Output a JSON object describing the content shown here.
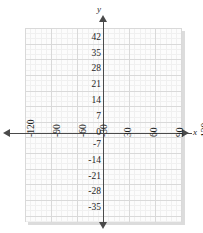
{
  "chart_data": {
    "type": "line",
    "title": "",
    "xlabel": "x",
    "ylabel": "y",
    "grid": true,
    "legend": null,
    "series": [],
    "xlim": [
      -130,
      130
    ],
    "ylim": [
      -38,
      45
    ],
    "x_ticks": [
      -120,
      -90,
      -60,
      -30,
      30,
      60,
      90,
      120
    ],
    "x_tick_labels": [
      "-120",
      "-90",
      "-60",
      "-30",
      "30",
      "60",
      "90",
      "120"
    ],
    "y_ticks": [
      42,
      35,
      28,
      21,
      14,
      7,
      -7,
      -14,
      -21,
      -28,
      -35
    ],
    "y_tick_labels": [
      "42",
      "35",
      "28",
      "21",
      "14",
      "7",
      "-7",
      "-14",
      "-21",
      "-28",
      "-35"
    ],
    "origin_label": "0",
    "x_major_step": 30,
    "y_major_step": 7,
    "x_minor_step": 6,
    "y_minor_step": 2.333,
    "colors": {
      "grid_major": "#d9d9d9",
      "grid_minor": "#f0f0f0",
      "plate": "#fcfcfc",
      "axis": "#4a4a4a",
      "shadow": "#dcdcdc",
      "text": "#1e1e1e"
    }
  },
  "axes": {
    "y_name": "y",
    "x_name": "x"
  },
  "y_labels": [
    {
      "text": "42",
      "top": 33
    },
    {
      "text": "35",
      "top": 49
    },
    {
      "text": "28",
      "top": 64
    },
    {
      "text": "21",
      "top": 80
    },
    {
      "text": "14",
      "top": 96
    },
    {
      "text": "7",
      "top": 112
    },
    {
      "text": "0",
      "top": 128
    },
    {
      "text": "-7",
      "top": 140
    },
    {
      "text": "-14",
      "top": 156
    },
    {
      "text": "-21",
      "top": 172
    },
    {
      "text": "-28",
      "top": 187
    },
    {
      "text": "-35",
      "top": 203
    }
  ],
  "x_labels": [
    {
      "text": "-120",
      "left": 26
    },
    {
      "text": "-90",
      "left": 52
    },
    {
      "text": "-60",
      "left": 78
    },
    {
      "text": "-30",
      "left": 99
    },
    {
      "text": "30",
      "left": 123
    },
    {
      "text": "60",
      "left": 149
    },
    {
      "text": "90",
      "left": 175
    },
    {
      "text": "120",
      "left": 200
    }
  ]
}
